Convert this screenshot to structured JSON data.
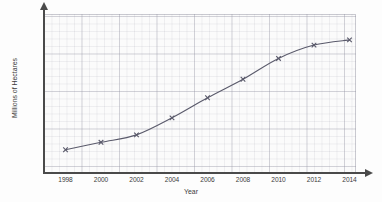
{
  "chart_data": {
    "type": "line",
    "title": "",
    "subtitle": "",
    "xlabel": "Year",
    "ylabel": "Millions of Hectares",
    "x": [
      1998,
      2000,
      2002,
      2004,
      2006,
      2008,
      2010,
      2012,
      2014
    ],
    "values": [
      30,
      40,
      50,
      73,
      100,
      125,
      153,
      171,
      178
    ],
    "series": [
      {
        "name": "Millions of Hectares",
        "values": [
          30,
          40,
          50,
          73,
          100,
          125,
          153,
          171,
          178
        ]
      }
    ],
    "xtick_labels": [
      "1998",
      "2000",
      "2002",
      "2004",
      "2006",
      "2008",
      "2010",
      "2012",
      "2014"
    ],
    "ytick_labels": [
      "0",
      "20",
      "40",
      "60",
      "80",
      "100",
      "120",
      "140",
      "160",
      "180"
    ],
    "ytick_values": [
      0,
      20,
      40,
      60,
      80,
      100,
      120,
      140,
      160,
      180
    ],
    "xlim": [
      1996.6,
      2016.4
    ],
    "ylim": [
      0,
      196
    ],
    "grid": true,
    "grid_style": "graph-paper minor and major squares",
    "legend": null,
    "legend_position": "none",
    "marker": "x",
    "line_color": "#5a5a6b",
    "marker_color": "#5a5a6b",
    "grid_color": "#9696a5",
    "axis_color": "#4a4a4a",
    "background": "#fbfbfb",
    "annotations": []
  },
  "axes": {
    "y_arrow": "arrow-up",
    "x_arrow": "arrow-right"
  }
}
